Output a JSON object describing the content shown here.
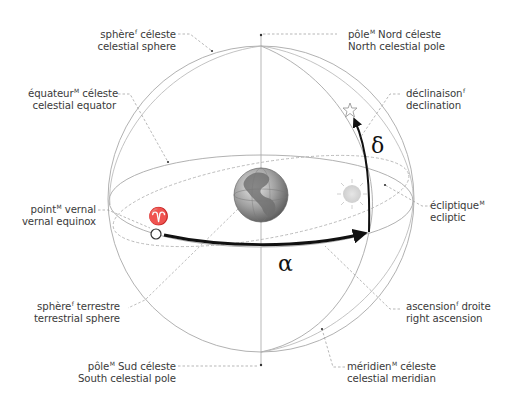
{
  "diagram": {
    "colors": {
      "background": "#ffffff",
      "sphere_line": "#a8a8a8",
      "leader_line": "#9a9a9a",
      "arrow": "#111111",
      "label_text": "#3a3a3a",
      "globe": "#8c8c8c",
      "sun": "#dcdcdc"
    },
    "symbols": {
      "vernal_point": "♈",
      "alpha": "α",
      "delta": "δ"
    },
    "labels": {
      "celestial_sphere": {
        "fr": "sphère",
        "fr_gender": "f",
        "fr_rest": " céleste",
        "en": "celestial sphere"
      },
      "north_pole": {
        "fr": "pôle",
        "fr_gender": "M",
        "fr_rest": " Nord céleste",
        "en": "North celestial pole"
      },
      "celestial_equator": {
        "fr": "équateur",
        "fr_gender": "M",
        "fr_rest": " céleste",
        "en": "celestial equator"
      },
      "declination": {
        "fr": "déclinaison",
        "fr_gender": "f",
        "fr_rest": "",
        "en": "declination"
      },
      "vernal_equinox": {
        "fr": "point",
        "fr_gender": "M",
        "fr_rest": " vernal",
        "en": "vernal equinox"
      },
      "ecliptic": {
        "fr": "écliptique",
        "fr_gender": "M",
        "fr_rest": "",
        "en": "ecliptic"
      },
      "terrestrial_sphere": {
        "fr": "sphère",
        "fr_gender": "f",
        "fr_rest": " terrestre",
        "en": "terrestrial sphere"
      },
      "right_ascension": {
        "fr": "ascension",
        "fr_gender": "f",
        "fr_rest": " droite",
        "en": "right ascension"
      },
      "south_pole": {
        "fr": "pôle",
        "fr_gender": "M",
        "fr_rest": " Sud céleste",
        "en": "South celestial pole"
      },
      "celestial_meridian": {
        "fr": "méridien",
        "fr_gender": "M",
        "fr_rest": " céleste",
        "en": "celestial meridian"
      }
    }
  }
}
